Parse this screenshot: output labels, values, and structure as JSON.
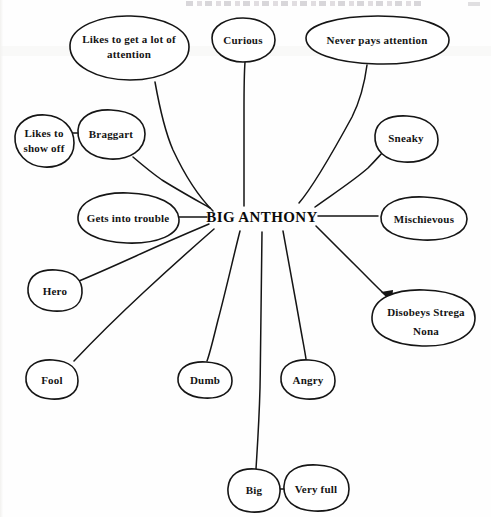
{
  "document": {
    "type": "hand-drawn character trait web diagram",
    "header_text": "",
    "center": {
      "label": "BIG ANTHONY",
      "x": 262,
      "y": 216
    },
    "ink_color": "#151515",
    "paper_color": "#fefefe"
  },
  "nodes": [
    {
      "id": "likes-attention",
      "label": "Likes to get a lot of\nattention",
      "cx": 129,
      "cy": 48,
      "rx": 60,
      "ry": 32,
      "label_x": 69,
      "label_y": 32,
      "label_w": 120,
      "connects_to": "center"
    },
    {
      "id": "curious",
      "label": "Curious",
      "cx": 243,
      "cy": 40,
      "rx": 32,
      "ry": 22,
      "label_x": 211,
      "label_y": 33,
      "label_w": 64,
      "connects_to": "center"
    },
    {
      "id": "never-pays-attention",
      "label": "Never pays attention",
      "cx": 377,
      "cy": 40,
      "rx": 72,
      "ry": 24,
      "label_x": 305,
      "label_y": 33,
      "label_w": 144,
      "connects_to": "center"
    },
    {
      "id": "likes-show-off",
      "label": "Likes to\nshow off",
      "cx": 44,
      "cy": 141,
      "rx": 30,
      "ry": 25,
      "label_x": 14,
      "label_y": 126,
      "label_w": 60,
      "connects_to": "braggart"
    },
    {
      "id": "braggart",
      "label": "Braggart",
      "cx": 111,
      "cy": 134,
      "rx": 34,
      "ry": 25,
      "label_x": 77,
      "label_y": 127,
      "label_w": 68,
      "connects_to": "center"
    },
    {
      "id": "sneaky",
      "label": "Sneaky",
      "cx": 406,
      "cy": 138,
      "rx": 32,
      "ry": 24,
      "label_x": 374,
      "label_y": 131,
      "label_w": 64,
      "connects_to": "center"
    },
    {
      "id": "gets-into-trouble",
      "label": "Gets into trouble",
      "cx": 128,
      "cy": 218,
      "rx": 51,
      "ry": 26,
      "label_x": 77,
      "label_y": 211,
      "label_w": 102,
      "connects_to": "center"
    },
    {
      "id": "mischievous",
      "label": "Mischievous",
      "cx": 424,
      "cy": 219,
      "rx": 43,
      "ry": 23,
      "label_x": 381,
      "label_y": 212,
      "label_w": 86,
      "connects_to": "center"
    },
    {
      "id": "hero",
      "label": "Hero",
      "cx": 55,
      "cy": 290,
      "rx": 27,
      "ry": 21,
      "label_x": 28,
      "label_y": 283,
      "label_w": 54,
      "connects_to": "center"
    },
    {
      "id": "disobeys-strega-nona",
      "label": "Disobeys Strega\nNona",
      "cx": 423,
      "cy": 318,
      "rx": 52,
      "ry": 29,
      "label_x": 371,
      "label_y": 302,
      "label_w": 104,
      "connects_to": "center"
    },
    {
      "id": "fool",
      "label": "Fool",
      "cx": 52,
      "cy": 379,
      "rx": 26,
      "ry": 20,
      "label_x": 26,
      "label_y": 372,
      "label_w": 52,
      "connects_to": "center"
    },
    {
      "id": "dumb",
      "label": "Dumb",
      "cx": 205,
      "cy": 380,
      "rx": 27,
      "ry": 19,
      "label_x": 178,
      "label_y": 373,
      "label_w": 54,
      "connects_to": "center"
    },
    {
      "id": "angry",
      "label": "Angry",
      "cx": 308,
      "cy": 379,
      "rx": 27,
      "ry": 20,
      "label_x": 281,
      "label_y": 372,
      "label_w": 54,
      "connects_to": "center"
    },
    {
      "id": "big",
      "label": "Big",
      "cx": 254,
      "cy": 490,
      "rx": 26,
      "ry": 21,
      "label_x": 228,
      "label_y": 483,
      "label_w": 52,
      "connects_to": "center"
    },
    {
      "id": "very-full",
      "label": "Very full",
      "cx": 316,
      "cy": 488,
      "rx": 32,
      "ry": 23,
      "label_x": 284,
      "label_y": 481,
      "label_w": 64,
      "connects_to": "big"
    }
  ],
  "edges": [
    {
      "id": "edge-center-likes-attention",
      "from": "center",
      "to": "likes-attention"
    },
    {
      "id": "edge-center-curious",
      "from": "center",
      "to": "curious"
    },
    {
      "id": "edge-center-never-pays-attention",
      "from": "center",
      "to": "never-pays-attention"
    },
    {
      "id": "edge-center-braggart",
      "from": "center",
      "to": "braggart"
    },
    {
      "id": "edge-braggart-likes-show-off",
      "from": "braggart",
      "to": "likes-show-off"
    },
    {
      "id": "edge-center-sneaky",
      "from": "center",
      "to": "sneaky"
    },
    {
      "id": "edge-center-gets-into-trouble",
      "from": "center",
      "to": "gets-into-trouble"
    },
    {
      "id": "edge-center-mischievous",
      "from": "center",
      "to": "mischievous"
    },
    {
      "id": "edge-center-hero",
      "from": "center",
      "to": "hero"
    },
    {
      "id": "edge-center-disobeys",
      "from": "center",
      "to": "disobeys-strega-nona"
    },
    {
      "id": "edge-center-fool",
      "from": "center",
      "to": "fool"
    },
    {
      "id": "edge-center-dumb",
      "from": "center",
      "to": "dumb"
    },
    {
      "id": "edge-center-angry",
      "from": "center",
      "to": "angry"
    },
    {
      "id": "edge-center-big",
      "from": "center",
      "to": "big"
    },
    {
      "id": "edge-big-very-full",
      "from": "big",
      "to": "very-full"
    }
  ]
}
